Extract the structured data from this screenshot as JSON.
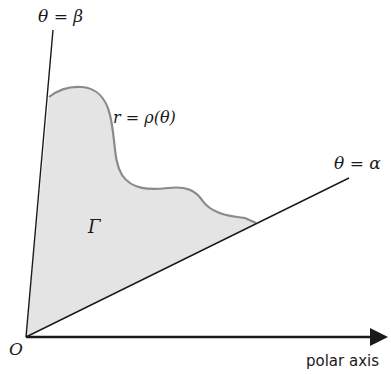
{
  "diagram": {
    "labels": {
      "beta_ray": "θ = β",
      "alpha_ray": "θ = α",
      "curve": "r = ρ(θ)",
      "region": "Γ",
      "origin": "O",
      "axis": "polar axis"
    },
    "colors": {
      "region_fill": "#e4e4e4",
      "curve_stroke": "#8a8a8a",
      "line": "#1a1a1a"
    }
  }
}
